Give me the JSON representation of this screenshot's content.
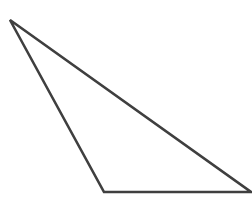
{
  "figure": {
    "kind": "geometric-figure",
    "background_color": "#ffffff",
    "canvas": {
      "width": 252,
      "height": 197
    },
    "shape": {
      "name": "triangle",
      "type": "polygon",
      "closed": true,
      "fill": "none",
      "stroke_color": "#3f3f3f",
      "stroke_width": 2.6,
      "vertices": [
        {
          "label": "apex-top-left",
          "x": 10,
          "y": 20
        },
        {
          "label": "bottom-left",
          "x": 104,
          "y": 192
        },
        {
          "label": "bottom-right",
          "x": 251,
          "y": 192
        }
      ],
      "points_attr": "10,20 104,192 251,192",
      "edges": [
        {
          "name": "left-edge",
          "from": "apex-top-left",
          "to": "bottom-left"
        },
        {
          "name": "base-edge",
          "from": "bottom-left",
          "to": "bottom-right"
        },
        {
          "name": "hypotenuse-edge",
          "from": "bottom-right",
          "to": "apex-top-left"
        }
      ]
    }
  }
}
